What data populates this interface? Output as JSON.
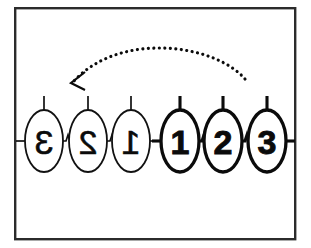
{
  "figure": {
    "background_color": "#ffffff",
    "frame": {
      "name": "border frame",
      "stroke_color": "#2b2b2b",
      "x": 14,
      "y": 7,
      "width": 282,
      "height": 233
    }
  },
  "chains": [
    {
      "id": "left-chain",
      "description": "mirrored chain, thin stroke",
      "mirrored": true,
      "stroke_weight": "thin",
      "nodes": [
        {
          "label": "3",
          "cx": 44,
          "cy": 141
        },
        {
          "label": "2",
          "cx": 88,
          "cy": 141
        },
        {
          "label": "1",
          "cx": 131,
          "cy": 141
        }
      ]
    },
    {
      "id": "right-chain",
      "description": "normal chain, bold stroke",
      "mirrored": false,
      "stroke_weight": "bold",
      "nodes": [
        {
          "label": "1",
          "cx": 180,
          "cy": 141
        },
        {
          "label": "2",
          "cx": 223,
          "cy": 141
        },
        {
          "label": "3",
          "cx": 267,
          "cy": 141
        }
      ]
    }
  ],
  "node_geometry": {
    "rx": 19,
    "ry": 31,
    "top_stub_length": 14,
    "side_stub_length": 9
  },
  "arrow": {
    "id": "reflection-arrow",
    "style": "dotted-arc",
    "direction": "right-to-left",
    "color": "#0b0b0b",
    "start_x": 245,
    "start_y": 79,
    "apex_x": 160,
    "apex_y": 44,
    "end_x": 74,
    "end_y": 81,
    "arrowhead": "chevron-down-left"
  }
}
